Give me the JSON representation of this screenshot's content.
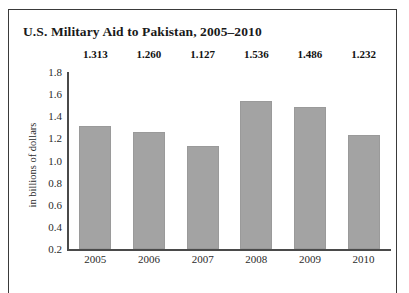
{
  "chart_data": {
    "type": "bar",
    "title": "U.S. Military Aid to Pakistan, 2005–2010",
    "xlabel": "",
    "ylabel": "in billions of dollars",
    "categories": [
      "2005",
      "2006",
      "2007",
      "2008",
      "2009",
      "2010"
    ],
    "values": [
      1.313,
      1.26,
      1.127,
      1.536,
      1.486,
      1.232
    ],
    "value_labels": [
      "1.313",
      "1.260",
      "1.127",
      "1.536",
      "1.486",
      "1.232"
    ],
    "ylim": [
      0.2,
      1.8
    ],
    "yticks": [
      1.8,
      1.6,
      1.4,
      1.2,
      1.0,
      0.8,
      0.6,
      0.4,
      0.2
    ],
    "ytick_labels": [
      "1.8",
      "1.6",
      "1.4",
      "1.2",
      "1.0",
      "0.8",
      "0.6",
      "0.4",
      "0.2"
    ],
    "grid": false,
    "legend": null,
    "bar_color": "#a3a3a3",
    "axis_color": "#4a4a4a",
    "background": "#ffffff"
  }
}
